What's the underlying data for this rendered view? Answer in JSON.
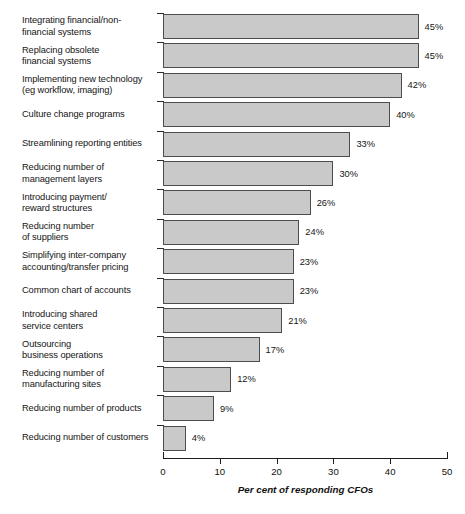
{
  "chart_data": {
    "type": "bar",
    "orientation": "horizontal",
    "title": "",
    "xlabel": "Per cent of responding CFOs",
    "ylabel": "",
    "xlim": [
      0,
      50
    ],
    "xticks": [
      0,
      10,
      20,
      30,
      40,
      50
    ],
    "xtick_labels": [
      "0",
      "10",
      "20",
      "30",
      "40",
      "50"
    ],
    "grid": false,
    "legend": false,
    "value_label_suffix": "%",
    "bar_fill_color": "#c9c9c9",
    "bar_edge_color": "#4d4d4d",
    "categories": [
      "Integrating financial/non-\nfinancial systems",
      "Replacing obsolete\nfinancial systems",
      "Implementing new technology\n(eg workflow, imaging)",
      "Culture change programs",
      "Streamlining reporting entities",
      "Reducing number of\nmanagement layers",
      "Introducing payment/\nreward structures",
      "Reducing number\nof suppliers",
      "Simplifying inter-company\naccounting/transfer pricing",
      "Common chart of accounts",
      "Introducing shared\nservice centers",
      "Outsourcing\nbusiness operations",
      "Reducing number of\nmanufacturing sites",
      "Reducing number of products",
      "Reducing number of customers"
    ],
    "values": [
      45,
      45,
      42,
      40,
      33,
      30,
      26,
      24,
      23,
      23,
      21,
      17,
      12,
      9,
      4
    ],
    "value_labels": [
      "45%",
      "45%",
      "42%",
      "40%",
      "33%",
      "30%",
      "26%",
      "24%",
      "23%",
      "23%",
      "21%",
      "17%",
      "12%",
      "9%",
      "4%"
    ]
  }
}
